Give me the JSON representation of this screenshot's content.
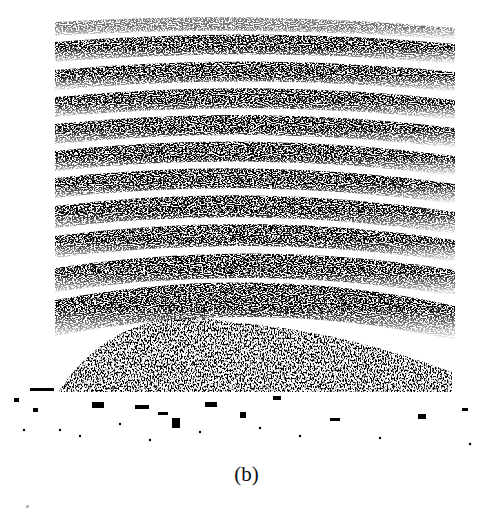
{
  "figure": {
    "label": "(b)",
    "pattern_region": {
      "x0": 55,
      "x1": 455,
      "y0": 15,
      "y1": 395
    },
    "band_count": 12,
    "ink_color": "#000000",
    "paper_color": "#ffffff"
  }
}
